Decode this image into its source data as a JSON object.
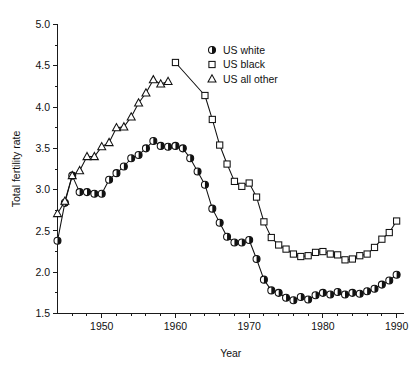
{
  "chart_data": {
    "type": "line",
    "title": "",
    "xlabel": "Year",
    "ylabel": "Total fertility rate",
    "xlim": [
      1944,
      1991
    ],
    "ylim": [
      1.5,
      5.0
    ],
    "xticks": [
      1950,
      1960,
      1970,
      1980,
      1990
    ],
    "xtick_labels": [
      "1950",
      "1960",
      "1970",
      "1980",
      "1990"
    ],
    "xtick_minor_step": 2,
    "yticks": [
      1.5,
      2.0,
      2.5,
      3.0,
      3.5,
      4.0,
      4.5,
      5.0
    ],
    "ytick_labels": [
      "1.5",
      "2.0",
      "2.5",
      "3.0",
      "3.5",
      "4.0",
      "4.5",
      "5.0"
    ],
    "ytick_minor_step": 0.25,
    "grid": false,
    "legend_position": "top-right",
    "series": [
      {
        "name": "US white",
        "marker": "half-filled-circle",
        "color": "#111111",
        "x": [
          1944,
          1945,
          1946,
          1947,
          1948,
          1949,
          1950,
          1951,
          1952,
          1953,
          1954,
          1955,
          1956,
          1957,
          1958,
          1959,
          1960,
          1961,
          1962,
          1963,
          1964,
          1965,
          1966,
          1967,
          1968,
          1969,
          1970,
          1971,
          1972,
          1973,
          1974,
          1975,
          1976,
          1977,
          1978,
          1979,
          1980,
          1981,
          1982,
          1983,
          1984,
          1985,
          1986,
          1987,
          1988,
          1989,
          1990
        ],
        "y": [
          2.38,
          2.84,
          3.17,
          2.97,
          2.97,
          2.95,
          2.95,
          3.12,
          3.2,
          3.28,
          3.38,
          3.42,
          3.5,
          3.59,
          3.53,
          3.52,
          3.53,
          3.5,
          3.38,
          3.22,
          3.06,
          2.77,
          2.6,
          2.43,
          2.36,
          2.36,
          2.39,
          2.16,
          1.91,
          1.78,
          1.75,
          1.69,
          1.66,
          1.7,
          1.67,
          1.72,
          1.75,
          1.73,
          1.76,
          1.73,
          1.75,
          1.74,
          1.77,
          1.8,
          1.85,
          1.9,
          1.97
        ]
      },
      {
        "name": "US black",
        "marker": "open-square",
        "color": "#111111",
        "x": [
          1960,
          1964,
          1965,
          1966,
          1967,
          1968,
          1969,
          1970,
          1971,
          1972,
          1973,
          1974,
          1975,
          1976,
          1977,
          1978,
          1979,
          1980,
          1981,
          1982,
          1983,
          1984,
          1985,
          1986,
          1987,
          1988,
          1989,
          1990
        ],
        "y": [
          4.54,
          4.14,
          3.85,
          3.54,
          3.31,
          3.1,
          3.04,
          3.08,
          2.91,
          2.61,
          2.42,
          2.33,
          2.28,
          2.22,
          2.19,
          2.2,
          2.24,
          2.25,
          2.22,
          2.21,
          2.15,
          2.16,
          2.2,
          2.22,
          2.3,
          2.4,
          2.48,
          2.62
        ]
      },
      {
        "name": "US all other",
        "marker": "open-triangle",
        "color": "#111111",
        "x": [
          1944,
          1945,
          1946,
          1947,
          1948,
          1949,
          1950,
          1951,
          1952,
          1953,
          1954,
          1955,
          1956,
          1957,
          1958,
          1959
        ],
        "y": [
          2.71,
          2.86,
          3.17,
          3.23,
          3.4,
          3.4,
          3.52,
          3.57,
          3.75,
          3.76,
          3.88,
          4.05,
          4.17,
          4.33,
          4.28,
          4.31
        ]
      }
    ]
  },
  "legend": {
    "items": [
      {
        "label": "US white",
        "marker": "half-filled-circle"
      },
      {
        "label": "US black",
        "marker": "open-square"
      },
      {
        "label": "US all other",
        "marker": "open-triangle"
      }
    ]
  }
}
